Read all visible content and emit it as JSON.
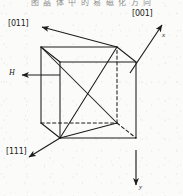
{
  "figure": {
    "caption_top": "图 晶 体 中 的 易 磁 化 方 向",
    "type": "crystallographic-cube-diagram",
    "background_color": "#fbfbf9",
    "line_color": "#1c1c1c"
  },
  "labels": {
    "direction_011": "[011]",
    "direction_001": "[001]",
    "direction_111": "[111]",
    "field_h": "H",
    "axis_x": "x",
    "axis_y": "y"
  },
  "geometry": {
    "cube": {
      "front_top_left": [
        60,
        62
      ],
      "front_top_right": [
        136,
        62
      ],
      "front_bottom_left": [
        60,
        138
      ],
      "front_bottom_right": [
        136,
        138
      ],
      "back_top_left": [
        41,
        47
      ],
      "back_top_right": [
        117,
        47
      ],
      "back_bottom_left": [
        41,
        123
      ],
      "back_bottom_right": [
        117,
        123
      ]
    },
    "hidden_edges": [
      "back_bottom_left-back_bottom_right",
      "back_bottom_right-back_top_right",
      "back_bottom_right-front_bottom_right"
    ],
    "diagonals": [
      "front_bottom_left-back_top_right",
      "back_top_left-back_bottom_right"
    ]
  },
  "arrows": [
    {
      "name": "arrow-011",
      "from": [
        117,
        47
      ],
      "to": [
        40,
        26
      ],
      "label": "[011]"
    },
    {
      "name": "arrow-001",
      "from": [
        117,
        123
      ],
      "to": [
        163,
        24
      ],
      "label": "[001]"
    },
    {
      "name": "arrow-111",
      "from": [
        60,
        138
      ],
      "to": [
        27,
        158
      ],
      "label": "[111]"
    },
    {
      "name": "arrow-h",
      "from": [
        60,
        75
      ],
      "to": [
        21,
        75
      ],
      "label": "H"
    },
    {
      "name": "arrow-x",
      "from": [
        117,
        123
      ],
      "to": [
        163,
        24
      ],
      "label": "x"
    },
    {
      "name": "arrow-y",
      "from": [
        136,
        138
      ],
      "to": [
        136,
        186
      ],
      "label": "y"
    }
  ]
}
